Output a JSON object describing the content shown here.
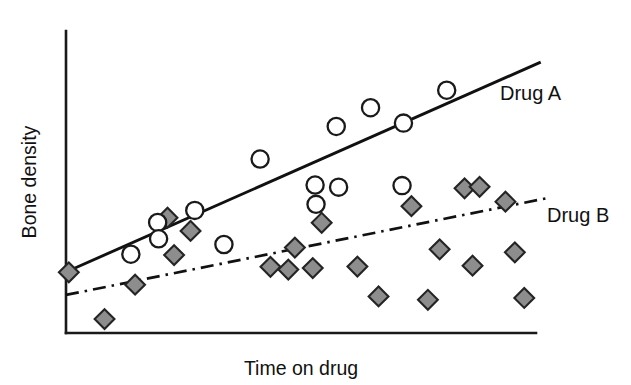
{
  "chart_data": {
    "type": "scatter",
    "title": "",
    "xlabel": "Time on drug",
    "ylabel": "Bone density",
    "grid": false,
    "legend_position": "inline-right-of-line-ends",
    "axes": {
      "x_axis_visible": true,
      "y_axis_visible": true,
      "ticks": false,
      "tick_labels": false,
      "xlim": [
        0,
        100
      ],
      "ylim": [
        0,
        100
      ],
      "note": "Axes are unlabeled/qualitative; values below are normalized 0-100 of the plot box."
    },
    "series": [
      {
        "name": "Drug A",
        "label": "Drug A",
        "marker": "open-circle",
        "marker_fill": "#ffffff",
        "marker_stroke": "#1a1a1a",
        "line_style": "solid",
        "line_color": "#111111",
        "trendline": {
          "x_start": 0.0,
          "y_start": 20.2,
          "x_end": 101.0,
          "y_end": 89.7
        },
        "label_position": {
          "x": 500,
          "y": 100
        },
        "points": [
          {
            "x": 13.8,
            "y": 26.1
          },
          {
            "x": 19.5,
            "y": 36.6
          },
          {
            "x": 19.7,
            "y": 31.2
          },
          {
            "x": 27.4,
            "y": 40.6
          },
          {
            "x": 33.6,
            "y": 29.3
          },
          {
            "x": 41.3,
            "y": 57.6
          },
          {
            "x": 53.0,
            "y": 49.0
          },
          {
            "x": 53.2,
            "y": 42.6
          },
          {
            "x": 57.5,
            "y": 68.4
          },
          {
            "x": 58.0,
            "y": 48.3
          },
          {
            "x": 64.8,
            "y": 74.6
          },
          {
            "x": 71.5,
            "y": 48.8
          },
          {
            "x": 71.8,
            "y": 69.5
          },
          {
            "x": 81.0,
            "y": 80.4
          }
        ]
      },
      {
        "name": "Drug B",
        "label": "Drug B",
        "marker": "filled-diamond",
        "marker_fill": "#8d8d8d",
        "marker_stroke": "#242424",
        "line_style": "dash-dot",
        "line_color": "#111111",
        "trendline": {
          "x_start": 0.0,
          "y_start": 12.6,
          "x_end": 102.5,
          "y_end": 44.7
        },
        "label_position": {
          "x": 547,
          "y": 222
        },
        "points": [
          {
            "x": 0.6,
            "y": 20.1
          },
          {
            "x": 8.2,
            "y": 4.6
          },
          {
            "x": 14.7,
            "y": 16.0
          },
          {
            "x": 21.6,
            "y": 38.2
          },
          {
            "x": 23.0,
            "y": 25.8
          },
          {
            "x": 26.5,
            "y": 33.8
          },
          {
            "x": 43.5,
            "y": 21.9
          },
          {
            "x": 47.3,
            "y": 21.0
          },
          {
            "x": 48.7,
            "y": 28.3
          },
          {
            "x": 52.5,
            "y": 21.5
          },
          {
            "x": 54.4,
            "y": 36.5
          },
          {
            "x": 62.0,
            "y": 22.0
          },
          {
            "x": 66.5,
            "y": 12.1
          },
          {
            "x": 73.5,
            "y": 42.0
          },
          {
            "x": 77.0,
            "y": 11.0
          },
          {
            "x": 79.5,
            "y": 27.7
          },
          {
            "x": 84.8,
            "y": 47.9
          },
          {
            "x": 88.0,
            "y": 48.4
          },
          {
            "x": 86.5,
            "y": 22.3
          },
          {
            "x": 93.5,
            "y": 43.5
          },
          {
            "x": 95.5,
            "y": 26.7
          },
          {
            "x": 97.5,
            "y": 11.6
          }
        ]
      }
    ]
  },
  "labels": {
    "drug_a": "Drug A",
    "drug_b": "Drug B",
    "x_title": "Time on drug",
    "y_title": "Bone density"
  }
}
